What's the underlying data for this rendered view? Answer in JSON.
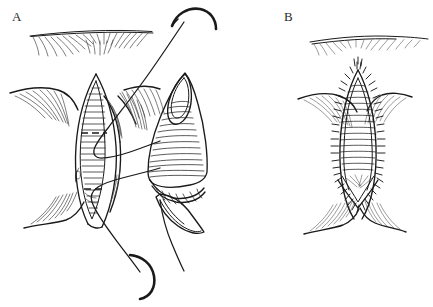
{
  "figure": {
    "type": "medical-line-illustration",
    "background_color": "#ffffff",
    "ink_color": "#1a1a1a",
    "width": 433,
    "height": 307,
    "panels": [
      {
        "id": "A",
        "label": "A",
        "caption_text": "A",
        "description": "Open operative field with elongated incision, mobilized flap held to the side, and two curved suture needles with threads passing through the tissue edges",
        "elements": [
          "skin-crease-line",
          "radiating-hatch-shading",
          "open-incision-wound",
          "wound-edge-left",
          "wound-edge-right",
          "mobilized-flap",
          "flap-tip",
          "dashed-marking-upper",
          "dashed-marking-lower",
          "suture-thread-upper",
          "suture-thread-lower",
          "curved-needle-top",
          "curved-needle-bottom"
        ]
      },
      {
        "id": "B",
        "label": "B",
        "caption_text": "B",
        "description": "Completed closure showing the flap inset with a continuous interrupted stitch line around the repaired defect",
        "elements": [
          "skin-crease-line",
          "radiating-hatch-shading",
          "closed-wound-body",
          "suture-line-left",
          "suture-line-right",
          "suture-line-apex",
          "suture-line-v-base",
          "transverse-hatch-shading"
        ]
      }
    ]
  },
  "labels": {
    "panel_a": "A",
    "panel_b": "B"
  }
}
